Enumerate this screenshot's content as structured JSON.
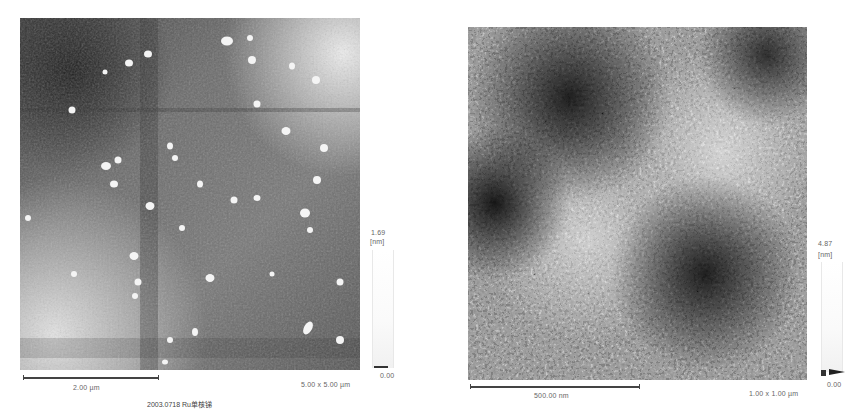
{
  "panels": [
    {
      "id": "left",
      "image_desc": "AFM height image, grey-scale, scattered bright particles on textured surface",
      "scale_bar_label": "2.00 µm",
      "scan_size": "5.00 x 5.00 µm",
      "colorbar": {
        "max": "1.69",
        "unit": "[nm]",
        "min": "0.00"
      }
    },
    {
      "id": "right",
      "image_desc": "AFM height image, grey-scale, granular surface with dark and light domains",
      "scale_bar_label": "500.00 nm",
      "scan_size": "1.00 x 1.00 µm",
      "colorbar": {
        "max": "4.87",
        "unit": "[nm]",
        "min": "0.00"
      }
    }
  ],
  "caption": "2003.0718 Ru单核锑"
}
